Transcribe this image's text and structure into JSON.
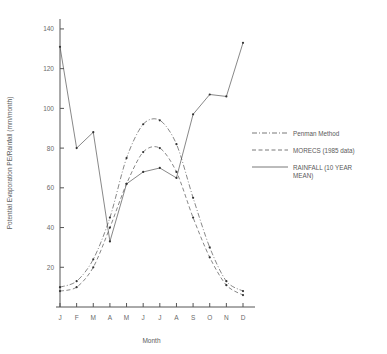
{
  "chart_data": {
    "type": "line",
    "title": "",
    "xlabel": "Month",
    "ylabel": "Potential Evaporation PE/Rainfall (mm/month)",
    "categories": [
      "J",
      "F",
      "M",
      "A",
      "M",
      "J",
      "J",
      "A",
      "S",
      "O",
      "N",
      "D"
    ],
    "xtick_labels": [
      "J",
      "F",
      "M",
      "A",
      "M",
      "J",
      "J",
      "A",
      "S",
      "O",
      "N",
      "D"
    ],
    "ytick_labels": [
      "20",
      "40",
      "60",
      "80",
      "100",
      "120",
      "140"
    ],
    "ytick_values": [
      20,
      40,
      60,
      80,
      100,
      120,
      140
    ],
    "ylim": [
      0,
      145
    ],
    "grid": false,
    "legend_position": "right",
    "series": [
      {
        "name": "Penman Method",
        "style": "dash-dot",
        "markers": true,
        "values": [
          10,
          13,
          24,
          45,
          75,
          92,
          94,
          82,
          55,
          30,
          13,
          8
        ]
      },
      {
        "name": "MORECS (1985 data)",
        "style": "dashed",
        "markers": true,
        "values": [
          8,
          10,
          20,
          40,
          62,
          78,
          80,
          68,
          45,
          25,
          11,
          6
        ]
      },
      {
        "name": "RAINFALL (10 YEAR MEAN)",
        "style": "solid",
        "markers": true,
        "values": [
          131,
          80,
          88,
          33,
          62,
          68,
          70,
          65,
          97,
          107,
          106,
          133
        ]
      }
    ]
  },
  "legend": {
    "items": [
      {
        "label": "Penman Method"
      },
      {
        "label": "MORECS (1985 data)"
      },
      {
        "label": "RAINFALL (10 YEAR",
        "label2": "MEAN)"
      }
    ]
  },
  "axes": {
    "x_axis_title": "Month",
    "y_axis_title": "Potential Evaporation PE/Rainfall (mm/month)"
  }
}
